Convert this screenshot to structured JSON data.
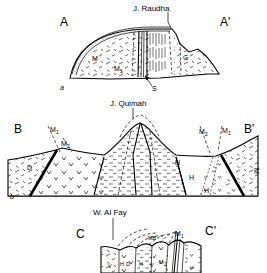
{
  "figure": {
    "background_color": "#ffffff",
    "line_color": "#000000"
  },
  "panels": [
    {
      "id": "a",
      "panel_label": "a",
      "peak_label": "J. Raudha",
      "left_end_label": "A",
      "right_end_label": "A'",
      "units": [
        {
          "label": "M",
          "x": 97,
          "y": 58
        },
        {
          "label": "M",
          "sub": "1",
          "x": 120,
          "y": 68
        },
        {
          "label": "G",
          "x": 186,
          "y": 57
        },
        {
          "label": "S",
          "x": 156,
          "y": 85
        }
      ]
    },
    {
      "id": "b",
      "panel_label": "b",
      "peak_label": "J. Quimah",
      "left_end_label": "B",
      "right_end_label": "B'",
      "units": [
        {
          "label": "M",
          "sub": "1",
          "x": 56,
          "y": 129
        },
        {
          "label": "M",
          "sub": "2",
          "x": 66,
          "y": 143
        },
        {
          "label": "D",
          "x": 29,
          "y": 167
        },
        {
          "label": "H",
          "x": 178,
          "y": 162
        },
        {
          "label": "H",
          "x": 192,
          "y": 177
        },
        {
          "label": "H",
          "x": 206,
          "y": 190
        },
        {
          "label": "M",
          "sub": "2",
          "x": 205,
          "y": 131
        },
        {
          "label": "M",
          "sub": "1",
          "x": 228,
          "y": 130
        },
        {
          "label": "M",
          "x": 255,
          "y": 165,
          "rotated": true
        }
      ]
    },
    {
      "id": "c",
      "panel_label": "c",
      "peak_label": "W. Al Fay",
      "left_end_label": "C",
      "right_end_label": "C'",
      "units": [
        {
          "label": "MB",
          "x": 152,
          "y": 238
        },
        {
          "label": "M",
          "sub": "1",
          "x": 180,
          "y": 233
        },
        {
          "label": "H",
          "x": 122,
          "y": 264
        },
        {
          "label": "D",
          "x": 129,
          "y": 264
        },
        {
          "label": "H",
          "x": 142,
          "y": 264
        },
        {
          "label": "M",
          "sub": "2",
          "x": 163,
          "y": 262
        },
        {
          "label": "S",
          "x": 189,
          "y": 263,
          "rotated": true
        },
        {
          "label": "V",
          "x": 110,
          "y": 266
        },
        {
          "label": "V",
          "x": 152,
          "y": 265
        }
      ]
    }
  ],
  "legend_units": {
    "M": "Basement / metamorphic unit",
    "M1": "Unit M one",
    "M2": "Unit M two",
    "MB": "Unit MB",
    "G": "Unit G",
    "S": "Unit S",
    "H": "Unit H",
    "D": "Unit D",
    "V": "Volcanics"
  }
}
